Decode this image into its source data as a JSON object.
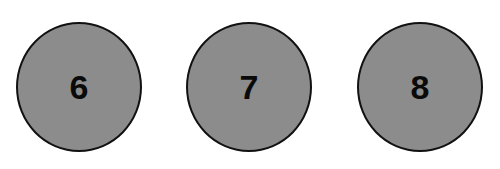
{
  "circles": [
    {
      "label": "6"
    },
    {
      "label": "7"
    },
    {
      "label": "8"
    }
  ],
  "colors": {
    "fill": "#8c8c8c",
    "stroke": "#111111",
    "text": "#0a0a0a"
  }
}
